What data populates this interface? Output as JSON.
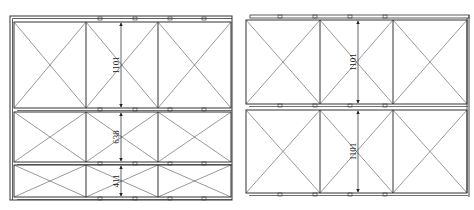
{
  "diagram": {
    "type": "cabinet-door-elevation",
    "line_color": "#333333",
    "panels": [
      {
        "id": "left-elevation",
        "frame": {
          "x": 10,
          "y": 16,
          "w": 222,
          "h": 184
        },
        "rail_offset": {
          "x": 4,
          "y": 3
        },
        "columns_x": [
          14,
          86,
          158,
          231
        ],
        "rows": [
          {
            "y": 22,
            "h": 86,
            "dimension": "1101"
          },
          {
            "y": 112,
            "h": 50,
            "dimension": "638"
          },
          {
            "y": 165,
            "h": 32,
            "dimension": "411"
          }
        ],
        "dimension_x": 121,
        "tabs_x": [
          98,
          133,
          168,
          202
        ]
      },
      {
        "id": "right-elevation",
        "frame": {
          "x": 246,
          "y": 15,
          "w": 223,
          "h": 183
        },
        "rail_offset": {
          "x": 4,
          "y": 3
        },
        "columns_x": [
          246,
          320,
          393,
          467
        ],
        "rows": [
          {
            "y": 20,
            "h": 84,
            "dimension": "1101"
          },
          {
            "y": 110,
            "h": 83,
            "dimension": "1101"
          }
        ],
        "dimension_x": 358,
        "tabs_x": [
          278,
          313,
          348,
          383
        ]
      }
    ],
    "dimension_labels": {
      "left_row1": "1101",
      "left_row2": "638",
      "left_row3": "411",
      "right_row1": "1101",
      "right_row2": "1101"
    }
  }
}
